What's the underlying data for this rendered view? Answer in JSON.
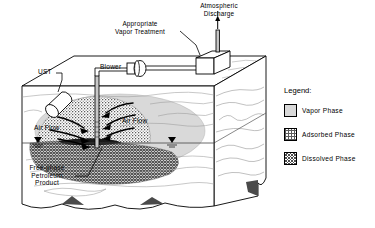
{
  "figure": {
    "type": "cutaway-block-diagram"
  },
  "labels": {
    "atmospheric_discharge": "Atmospheric\nDischarge",
    "vapor_treatment": "Appropriate\nVapor Treatment",
    "blower": "Blower",
    "ust": "UST",
    "air_flow_left": "Air Flow",
    "air_flow_right": "Air Flow",
    "free_phase": "Free-phase\nPetroleum\nProduct"
  },
  "legend": {
    "title": "Legend:",
    "items": [
      {
        "label": "Vapor Phase",
        "pattern": "solid-light-gray",
        "color": "#d9d9d9"
      },
      {
        "label": "Adsorbed Phase",
        "pattern": "stipple-dots",
        "color": "#9a9a9a"
      },
      {
        "label": "Dissolved Phase",
        "pattern": "cross-hatch",
        "color": "#6e6e6e"
      }
    ]
  },
  "colors": {
    "outline": "#000000",
    "vapor_phase": "#d9d9d9",
    "adsorbed_phase": "#a8a8a8",
    "dissolved_phase": "#787878",
    "strata_line": "#8a8a8a",
    "block_face": "#ffffff",
    "shadow_wedge": "#4a4a4a",
    "pipe_fill": "#c8c8c8"
  }
}
